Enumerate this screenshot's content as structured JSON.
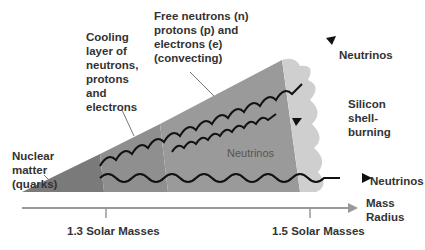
{
  "labels": {
    "nuclear_matter": [
      "Nuclear",
      "matter",
      "(quarks)"
    ],
    "cooling_layer": [
      "Cooling",
      "layer of",
      "neutrons,",
      "protons",
      "and",
      "electrons"
    ],
    "free_particles": [
      "Free neutrons (n)",
      "protons (p) and",
      "electrons  (e)",
      "(convecting)"
    ],
    "neutrinos_top": "Neutrinos",
    "neutrinos_inner": "Neutrinos",
    "neutrinos_bottom": "Neutrinos",
    "silicon_shell": [
      "Silicon",
      "shell-",
      "burning"
    ]
  },
  "axis": {
    "label": [
      "Mass",
      "Radius"
    ],
    "ticks": [
      {
        "label": "1.3 Solar Masses"
      },
      {
        "label": "1.5 Solar Masses"
      }
    ]
  },
  "colors": {
    "core": "#7a7a7a",
    "cooling": "#8f8f8f",
    "convecting": "#9a9a9a",
    "silicon": "#cfcfcf",
    "text": "#333333",
    "axis": "#999999"
  }
}
